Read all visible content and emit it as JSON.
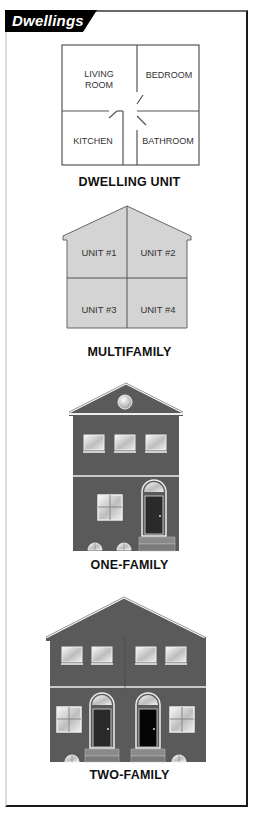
{
  "header": {
    "title": "Dwellings"
  },
  "figures": [
    {
      "id": "dwelling-unit",
      "caption": "DWELLING UNIT",
      "rooms": [
        "LIVING",
        "ROOM",
        "BEDROOM",
        "KITCHEN",
        "BATHROOM"
      ]
    },
    {
      "id": "multifamily",
      "caption": "MULTIFAMILY",
      "units": [
        "UNIT #1",
        "UNIT #2",
        "UNIT #3",
        "UNIT #4"
      ]
    },
    {
      "id": "one-family",
      "caption": "ONE-FAMILY"
    },
    {
      "id": "two-family",
      "caption": "TWO-FAMILY"
    }
  ],
  "colors": {
    "header_bg": "#000000",
    "house_wall": "#595959",
    "multifamily_fill": "#d4d4d4",
    "trim": "#e8e8e8",
    "door_dark": "#2a2a2a",
    "door_black": "#050505",
    "step": "#8a8a8a"
  }
}
